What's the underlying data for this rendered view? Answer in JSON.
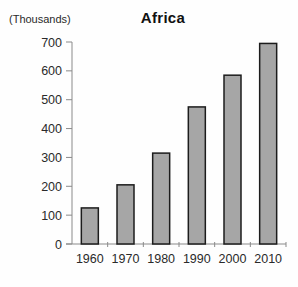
{
  "chart_data": {
    "type": "bar",
    "title": "Africa",
    "ylabel": "(Thousands)",
    "xlabel": "",
    "categories": [
      "1960",
      "1970",
      "1980",
      "1990",
      "2000",
      "2010"
    ],
    "values": [
      125,
      205,
      315,
      475,
      585,
      695
    ],
    "ylim": [
      0,
      700
    ],
    "yticks": [
      0,
      100,
      200,
      300,
      400,
      500,
      600,
      700
    ],
    "grid": false,
    "legend": "none",
    "colors": {
      "bar_fill": "#a6a6a6",
      "bar_border": "#1c1c1c",
      "axis_line": "#8a8a8a",
      "tick_label": "#2a2a2a",
      "background": "#fefefe"
    }
  }
}
